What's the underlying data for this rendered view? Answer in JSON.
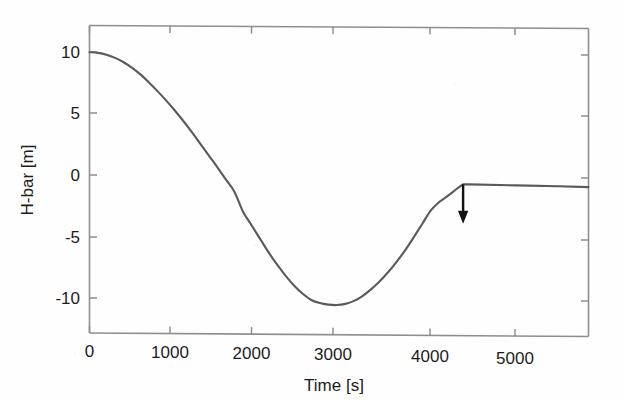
{
  "chart_data": {
    "type": "line",
    "title": "",
    "xlabel": "Time [s]",
    "ylabel": "H-bar [m]",
    "xlim": [
      0,
      5850
    ],
    "ylim": [
      -12.2,
      12.0
    ],
    "xticks": [
      0,
      1000,
      2000,
      3000,
      4000,
      5000
    ],
    "xtick_labels": [
      "0",
      "1000",
      "2000",
      "3000",
      "4000",
      "5000"
    ],
    "yticks": [
      10,
      5,
      0,
      -5,
      -10
    ],
    "ytick_labels": [
      "10",
      "5",
      "0",
      "-5",
      "-10"
    ],
    "grid": false,
    "legend": null,
    "line_color": "#5a5a5a",
    "axis_color": "#8e8e8e",
    "annotation_color": "#121212",
    "series": [
      {
        "name": "H-bar",
        "x": [
          0,
          100,
          200,
          300,
          400,
          500,
          600,
          700,
          800,
          900,
          1000,
          1100,
          1200,
          1300,
          1400,
          1500,
          1600,
          1700,
          1800,
          1900,
          2000,
          2100,
          2200,
          2300,
          2400,
          2500,
          2600,
          2700,
          2800,
          2900,
          3000,
          3100,
          3200,
          3300,
          3400,
          3500,
          3600,
          3700,
          3800,
          3900,
          4000,
          4100,
          4200,
          4300,
          4380,
          4450,
          5000,
          5500,
          5850
        ],
        "y": [
          10.0,
          9.95,
          9.8,
          9.55,
          9.2,
          8.75,
          8.2,
          7.55,
          6.85,
          6.1,
          5.3,
          4.45,
          3.55,
          2.6,
          1.65,
          0.7,
          -0.3,
          -1.3,
          -2.9,
          -4.0,
          -5.1,
          -6.2,
          -7.2,
          -8.1,
          -8.9,
          -9.55,
          -10.05,
          -10.3,
          -10.42,
          -10.45,
          -10.35,
          -10.1,
          -9.7,
          -9.15,
          -8.5,
          -7.75,
          -6.9,
          -5.95,
          -4.9,
          -3.8,
          -2.7,
          -2.0,
          -1.5,
          -0.95,
          -0.55,
          -0.55,
          -0.6,
          -0.65,
          -0.7
        ]
      }
    ],
    "annotations": [
      {
        "name": "down-arrow",
        "type": "arrow",
        "x": 4380,
        "y_start": -0.55,
        "y_end": -3.75,
        "direction": "down",
        "label": ""
      }
    ],
    "notes": {
      "curve_start_value": 10.0,
      "curve_minimum_value": -10.45,
      "curve_minimum_time": 2900,
      "plateau_value": -0.6,
      "corner_time": 4380
    }
  },
  "figure": {
    "background_color": "#fefefe"
  }
}
